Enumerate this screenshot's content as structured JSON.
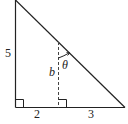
{
  "diagram": {
    "type": "right-triangle-with-altitude-segment",
    "labels": {
      "left_side": "5",
      "bottom_left_segment": "2",
      "bottom_right_segment": "3",
      "dashed_segment": "b",
      "angle": "θ"
    },
    "colors": {
      "stroke": "#222222",
      "background": "#ffffff"
    }
  }
}
